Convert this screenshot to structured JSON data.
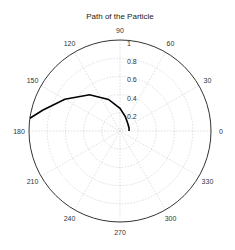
{
  "chart_data": {
    "type": "line",
    "subtype": "polar",
    "title": "Path of the Particle",
    "angle_ticks": [
      "0",
      "30",
      "60",
      "90",
      "120",
      "150",
      "180",
      "210",
      "240",
      "270",
      "300",
      "330"
    ],
    "radial_ticks": [
      "0.2",
      "0.4",
      "0.6",
      "0.8",
      "1"
    ],
    "rlim": [
      0,
      1
    ],
    "grid": true,
    "series": [
      {
        "name": "path",
        "color": "#000000",
        "theta_deg": [
          0,
          5,
          20,
          45,
          70,
          90,
          110,
          130,
          150,
          165,
          172
        ],
        "r": [
          0.1,
          0.1,
          0.105,
          0.12,
          0.17,
          0.25,
          0.37,
          0.52,
          0.7,
          0.88,
          1.0
        ]
      }
    ]
  }
}
